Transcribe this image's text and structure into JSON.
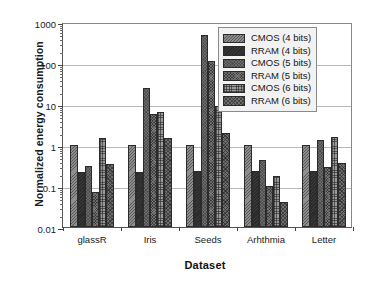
{
  "chart_data": {
    "type": "bar",
    "title": "",
    "xlabel": "Dataset",
    "ylabel": "Normalized energy consumption",
    "yscale": "log",
    "ylim": [
      0.01,
      1000
    ],
    "ytick_labels": [
      "1000",
      "100",
      "10",
      "1",
      "0.1",
      "0.01"
    ],
    "ytick_values": [
      1000,
      100,
      10,
      1,
      0.1,
      0.01
    ],
    "grid": true,
    "legend_position": "top-right",
    "categories": [
      "glassR",
      "Iris",
      "Seeds",
      "Arhthmia",
      "Letter"
    ],
    "series": [
      {
        "name": "CMOS (4 bits)",
        "values": [
          1.0,
          1.0,
          1.0,
          1.0,
          1.0
        ]
      },
      {
        "name": "RRAM (4 bits)",
        "values": [
          0.22,
          0.22,
          0.235,
          0.235,
          0.235
        ]
      },
      {
        "name": "CMOS (5 bits)",
        "values": [
          0.31,
          25.0,
          480.0,
          0.42,
          1.3
        ]
      },
      {
        "name": "RRAM (5 bits)",
        "values": [
          0.07,
          5.8,
          115.0,
          0.098,
          0.29
        ]
      },
      {
        "name": "CMOS (6 bits)",
        "values": [
          1.5,
          6.5,
          9.0,
          0.175,
          1.55
        ]
      },
      {
        "name": "RRAM (6 bits)",
        "values": [
          0.35,
          1.5,
          2.0,
          0.04,
          0.355
        ]
      }
    ],
    "series_fill_keys": [
      "cmos4",
      "rram4",
      "cmos5",
      "rram5",
      "cmos6",
      "rram6"
    ]
  },
  "legend": {
    "items": [
      {
        "label": "CMOS (4 bits)",
        "swatch": "cmos4"
      },
      {
        "label": "RRAM (4 bits)",
        "swatch": "rram4"
      },
      {
        "label": "CMOS (5 bits)",
        "swatch": "cmos5"
      },
      {
        "label": "RRAM (5 bits)",
        "swatch": "rram5"
      },
      {
        "label": "CMOS (6 bits)",
        "swatch": "cmos6"
      },
      {
        "label": "RRAM (6 bits)",
        "swatch": "rram6"
      }
    ]
  },
  "colors": {
    "axis": "#555555",
    "grid": "#b9b9b9",
    "text": "#1a1a1a",
    "legend_bg": "#f2f2f2",
    "legend_border": "#8a8a8a"
  }
}
